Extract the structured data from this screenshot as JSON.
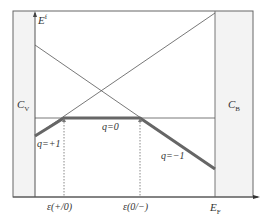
{
  "diagram": {
    "type": "defect-formation-energy-vs-fermi-level",
    "y_axis": {
      "label": "E",
      "label_sup": "f"
    },
    "x_axis": {
      "label": "E",
      "label_sub": "F"
    },
    "regions": {
      "left": {
        "label": "C",
        "label_sub": "V",
        "fill": "#f2f2f2"
      },
      "right": {
        "label": "C",
        "label_sub": "B",
        "fill": "#f2f2f2"
      }
    },
    "charge_states": [
      {
        "label": "q=+1"
      },
      {
        "label": "q=0"
      },
      {
        "label": "q=−1"
      }
    ],
    "transition_levels": [
      {
        "label": "ε(+/0)"
      },
      {
        "label": "ε(0/−)"
      }
    ],
    "colors": {
      "thin_line": "#555555",
      "thick_line": "#666666",
      "frame": "#555555",
      "dotted": "#888888"
    }
  }
}
